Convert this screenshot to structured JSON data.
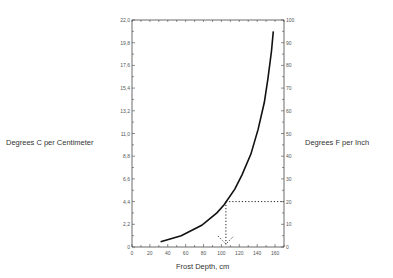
{
  "chart_data": {
    "type": "line",
    "title": "",
    "xlabel": "Frost Depth, cm",
    "ylabel": "Degrees C per Centimeter",
    "ylabel_right": "Degrees F per Inch",
    "xlim": [
      0,
      170
    ],
    "ylim": [
      0,
      22.0
    ],
    "ylim_right": [
      0,
      100
    ],
    "x_ticks": [
      0,
      20,
      40,
      60,
      80,
      100,
      120,
      140,
      160
    ],
    "y_ticks": [
      "0",
      "2,2",
      "4,4",
      "6,6",
      "8,8",
      "11,0",
      "13,2",
      "15,4",
      "17,6",
      "19,8",
      "22,0"
    ],
    "y_ticks_right": [
      "0",
      "10",
      "20",
      "30",
      "40",
      "50",
      "60",
      "70",
      "80",
      "90",
      "100"
    ],
    "grid": false,
    "legend": null,
    "series": [
      {
        "name": "gradient vs frost depth",
        "x": [
          32,
          55,
          78,
          95,
          103,
          115,
          123,
          133,
          141,
          148,
          152,
          156,
          158
        ],
        "y": [
          0.5,
          1.1,
          2.1,
          3.3,
          4.1,
          5.6,
          7.0,
          9.0,
          11.4,
          14.0,
          16.3,
          19.0,
          20.9
        ]
      }
    ],
    "annotations": [
      {
        "type": "dotted-guide",
        "description": "Horizontal dotted line from right axis at 20 °F/in (4.4 °C/cm) to curve, then vertical dotted line down to x-axis with arrow",
        "x": 105,
        "y": 4.4,
        "y_right": 20
      }
    ]
  },
  "labels": {
    "left": "Degrees C per Centimeter",
    "right": "Degrees F per Inch",
    "bottom": "Frost Depth, cm"
  }
}
